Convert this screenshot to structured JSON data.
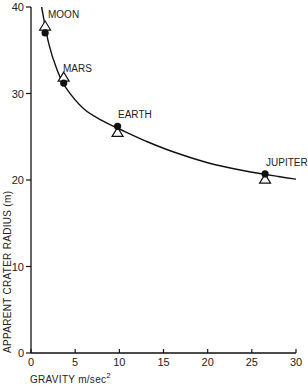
{
  "chart_data": {
    "type": "scatter",
    "title": "",
    "xlabel": "GRAVITY m/sec²",
    "ylabel": "APPARENT CRATER RADIUS (m)",
    "xlim": [
      0,
      30
    ],
    "ylim": [
      0,
      40
    ],
    "x_ticks": [
      0,
      5,
      10,
      15,
      20,
      25,
      30
    ],
    "y_ticks": [
      0,
      10,
      20,
      30,
      40
    ],
    "grid": false,
    "legend": null,
    "series": [
      {
        "name": "filled-circles",
        "marker": "circle-filled",
        "points": [
          {
            "label": "MOON",
            "x": 1.6,
            "y": 37.0
          },
          {
            "label": "MARS",
            "x": 3.7,
            "y": 31.2
          },
          {
            "label": "EARTH",
            "x": 9.8,
            "y": 26.2
          },
          {
            "label": "JUPITER",
            "x": 26.5,
            "y": 20.7
          }
        ]
      },
      {
        "name": "open-triangles",
        "marker": "triangle-open",
        "points": [
          {
            "label": "MOON",
            "x": 1.6,
            "y": 37.8
          },
          {
            "label": "MARS",
            "x": 3.7,
            "y": 31.9
          },
          {
            "label": "EARTH",
            "x": 9.8,
            "y": 25.5
          },
          {
            "label": "JUPITER",
            "x": 26.5,
            "y": 20.1
          }
        ]
      },
      {
        "name": "fit-curve",
        "marker": "line",
        "points": [
          {
            "x": 1.2,
            "y": 40.0
          },
          {
            "x": 2.0,
            "y": 35.8
          },
          {
            "x": 3.0,
            "y": 32.6
          },
          {
            "x": 4.0,
            "y": 30.6
          },
          {
            "x": 6.0,
            "y": 28.2
          },
          {
            "x": 8.0,
            "y": 26.9
          },
          {
            "x": 10.0,
            "y": 25.9
          },
          {
            "x": 13.0,
            "y": 24.5
          },
          {
            "x": 16.0,
            "y": 23.3
          },
          {
            "x": 20.0,
            "y": 22.0
          },
          {
            "x": 24.0,
            "y": 21.1
          },
          {
            "x": 28.0,
            "y": 20.4
          },
          {
            "x": 30.0,
            "y": 20.1
          }
        ]
      }
    ],
    "annotations": [
      "MOON",
      "MARS",
      "EARTH",
      "JUPITER"
    ]
  },
  "axes": {
    "x_title": "GRAVITY m/sec",
    "x_title_sup": "2",
    "y_title": "APPARENT CRATER RADIUS (m)",
    "x_tick_labels": [
      "0",
      "5",
      "10",
      "15",
      "20",
      "25",
      "30"
    ],
    "y_tick_labels": [
      "0",
      "10",
      "20",
      "30",
      "40"
    ]
  },
  "labels": {
    "moon": "MOON",
    "mars": "MARS",
    "earth": "EARTH",
    "jupiter": "JUPITER"
  }
}
